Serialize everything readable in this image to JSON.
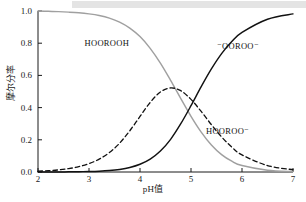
{
  "chart_data": {
    "type": "line",
    "title": "",
    "subtitle": "",
    "xlabel": "pH值",
    "ylabel": "摩尔分率",
    "xlim": [
      2,
      7
    ],
    "ylim": [
      0.0,
      1.0
    ],
    "xticks": [
      "2",
      "3",
      "4",
      "5",
      "6",
      "7"
    ],
    "yticks": [
      "0.0",
      "0.2",
      "0.4",
      "0.6",
      "0.8",
      "1.0"
    ],
    "grid": false,
    "legend_position": "inline-annotations",
    "series": [
      {
        "name": "HOOROOH",
        "label": "HOOROOH",
        "style": "solid",
        "color": "#a0a0a0",
        "x": [
          2.0,
          2.2,
          2.4,
          2.6,
          2.8,
          3.0,
          3.2,
          3.4,
          3.6,
          3.8,
          4.0,
          4.2,
          4.4,
          4.6,
          4.8,
          5.0,
          5.2,
          5.4,
          5.6,
          5.8,
          6.0,
          6.5,
          7.0
        ],
        "values": [
          1.0,
          0.998,
          0.996,
          0.993,
          0.989,
          0.982,
          0.972,
          0.956,
          0.931,
          0.894,
          0.841,
          0.768,
          0.676,
          0.569,
          0.456,
          0.346,
          0.248,
          0.168,
          0.108,
          0.067,
          0.04,
          0.011,
          0.003
        ]
      },
      {
        "name": "HOOROO-",
        "label": "HOOROO⁻",
        "style": "dashed",
        "color": "#111111",
        "x": [
          2.0,
          2.2,
          2.4,
          2.6,
          2.8,
          3.0,
          3.2,
          3.4,
          3.6,
          3.8,
          4.0,
          4.2,
          4.4,
          4.6,
          4.8,
          5.0,
          5.2,
          5.4,
          5.6,
          5.8,
          6.0,
          6.5,
          7.0
        ],
        "values": [
          0.005,
          0.008,
          0.013,
          0.021,
          0.033,
          0.052,
          0.08,
          0.121,
          0.179,
          0.256,
          0.345,
          0.432,
          0.497,
          0.522,
          0.505,
          0.451,
          0.376,
          0.294,
          0.218,
          0.155,
          0.106,
          0.04,
          0.014
        ]
      },
      {
        "name": "-OOROO-",
        "label": "⁻OOROO⁻",
        "style": "solid",
        "color": "#111111",
        "x": [
          2.0,
          2.2,
          2.4,
          2.6,
          2.8,
          3.0,
          3.2,
          3.4,
          3.6,
          3.8,
          4.0,
          4.2,
          4.4,
          4.6,
          4.8,
          5.0,
          5.2,
          5.4,
          5.6,
          5.8,
          6.0,
          6.5,
          7.0
        ],
        "values": [
          0.0,
          0.0,
          0.0,
          0.001,
          0.002,
          0.003,
          0.005,
          0.009,
          0.016,
          0.028,
          0.048,
          0.08,
          0.13,
          0.203,
          0.3,
          0.412,
          0.53,
          0.64,
          0.735,
          0.81,
          0.867,
          0.949,
          0.982
        ]
      }
    ],
    "annotations": [
      {
        "text": "HOOROOH",
        "x": 3.35,
        "y": 0.8,
        "series": "HOOROOH"
      },
      {
        "text": "⁻OOROO⁻",
        "x": 5.92,
        "y": 0.785,
        "series": "-OOROO-"
      },
      {
        "text": "HOOROO⁻",
        "x": 5.72,
        "y": 0.255,
        "series": "HOOROO-"
      }
    ]
  },
  "figure": {
    "background_color": "#ffffff",
    "axis_color": "#1a1a1a",
    "top_band_color": "#e4e4e4"
  }
}
